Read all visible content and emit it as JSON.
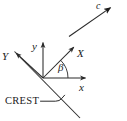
{
  "figure": {
    "kind": "coordinate-axes-diagram",
    "background_color": "#ffffff",
    "line_color": "#2a2a2a",
    "text_color": "#1a1a1a",
    "width": 127,
    "height": 121,
    "labels": {
      "axis_y_lower": "y",
      "axis_x_lower": "x",
      "axis_X_upper": "X",
      "axis_Y_upper": "Y",
      "wave_vector": "c",
      "angle": "β",
      "crest": "CREST"
    },
    "geometry": {
      "origin": {
        "x": 43,
        "y": 78
      },
      "axis_y_lower": {
        "from": [
          43,
          78
        ],
        "to": [
          43,
          40
        ],
        "arrow": true
      },
      "axis_x_lower": {
        "from": [
          43,
          78
        ],
        "to": [
          88,
          78
        ],
        "arrow": true
      },
      "axis_X_upper": {
        "from": [
          43,
          78
        ],
        "to": [
          76,
          45
        ],
        "arrow": true
      },
      "axis_Y_upper": {
        "from": [
          43,
          78
        ],
        "to": [
          14,
          51
        ],
        "arrow": true
      },
      "crest_line": {
        "from": [
          14,
          51
        ],
        "to": [
          80,
          118
        ]
      },
      "wave_vector_c": {
        "from": [
          69,
          36
        ],
        "to": [
          114,
          5
        ],
        "arrow": true
      },
      "angle_arc": {
        "center": [
          43,
          78
        ],
        "radius": 25,
        "start_deg": 0,
        "end_deg": 45
      },
      "crest_leader": {
        "from": [
          40,
          101
        ],
        "to": [
          57,
          101
        ],
        "hook_to": [
          64,
          94
        ]
      }
    }
  }
}
